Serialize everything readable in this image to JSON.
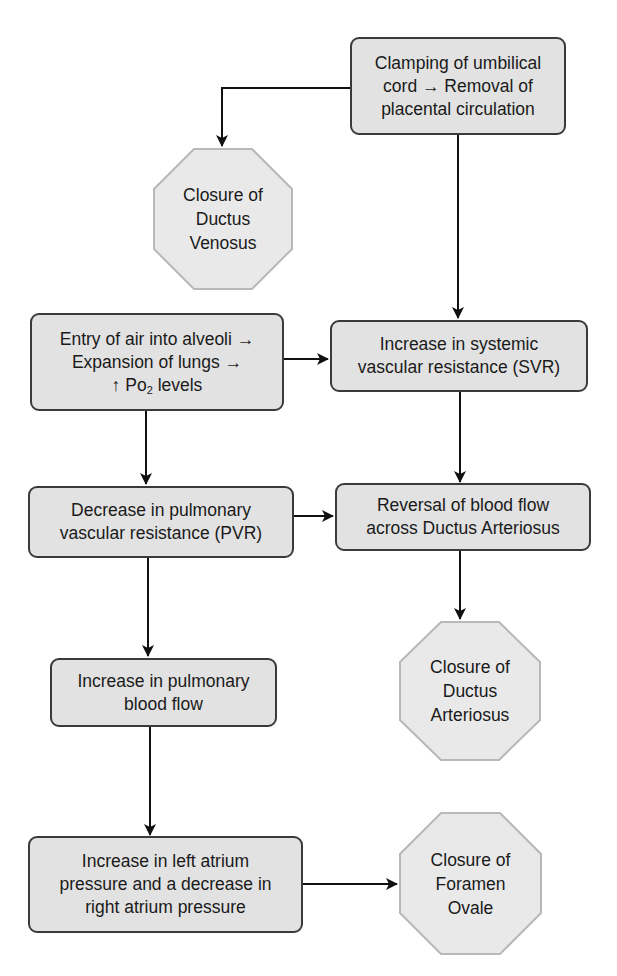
{
  "diagram": {
    "nodes": {
      "clamping": {
        "lines": [
          "Clamping of umbilical",
          "cord → Removal of",
          "placental circulation"
        ]
      },
      "closure_dv": {
        "lines": [
          "Closure of",
          "Ductus",
          "Venosus"
        ]
      },
      "air_entry": {
        "lines": [
          "Entry of air into alveoli →",
          "Expansion of lungs →",
          "↑ Po"
        ],
        "subscript": "2",
        "suffix": " levels"
      },
      "svr": {
        "lines": [
          "Increase in systemic",
          "vascular resistance (SVR)"
        ]
      },
      "pvr": {
        "lines": [
          "Decrease in pulmonary",
          "vascular resistance (PVR)"
        ]
      },
      "reversal": {
        "lines": [
          "Reversal of blood flow",
          "across Ductus Arteriosus"
        ]
      },
      "closure_da": {
        "lines": [
          "Closure of",
          "Ductus",
          "Arteriosus"
        ]
      },
      "pulm_flow": {
        "lines": [
          "Increase in pulmonary",
          "blood flow"
        ]
      },
      "atrium": {
        "lines": [
          "Increase in left atrium",
          "pressure and a decrease in",
          "right atrium pressure"
        ]
      },
      "closure_fo": {
        "lines": [
          "Closure of",
          "Foramen",
          "Ovale"
        ]
      }
    },
    "edges": [
      [
        "clamping",
        "closure_dv"
      ],
      [
        "clamping",
        "svr"
      ],
      [
        "air_entry",
        "svr"
      ],
      [
        "air_entry",
        "pvr"
      ],
      [
        "svr",
        "reversal"
      ],
      [
        "pvr",
        "reversal"
      ],
      [
        "reversal",
        "closure_da"
      ],
      [
        "pvr",
        "pulm_flow"
      ],
      [
        "pulm_flow",
        "atrium"
      ],
      [
        "atrium",
        "closure_fo"
      ]
    ],
    "colors": {
      "box_fill": "#e2e2e2",
      "box_border": "#3a3a3a",
      "octagon_fill": "#e9e9e9",
      "octagon_border": "#b8b8b8",
      "arrow": "#111111"
    }
  }
}
